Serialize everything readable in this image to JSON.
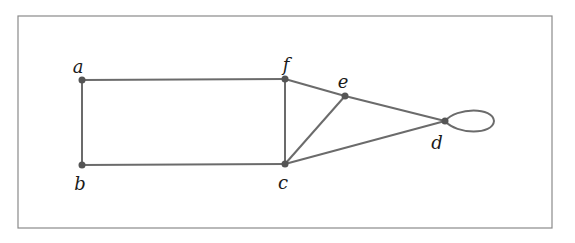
{
  "diagram": {
    "type": "graph",
    "frame": {
      "x": 18,
      "y": 16,
      "width": 534,
      "height": 212,
      "stroke": "#8a8a8a"
    },
    "colors": {
      "edge": "#6b6b6b",
      "node": "#555555",
      "label": "#1a1a1a"
    },
    "nodes": [
      {
        "id": "a",
        "label": "a",
        "x": 82,
        "y": 80,
        "lx": 78,
        "ly": 73
      },
      {
        "id": "b",
        "label": "b",
        "x": 82,
        "y": 165,
        "lx": 80,
        "ly": 190
      },
      {
        "id": "f",
        "label": "f",
        "x": 285,
        "y": 79,
        "lx": 286,
        "ly": 71
      },
      {
        "id": "c",
        "label": "c",
        "x": 285,
        "y": 164,
        "lx": 283,
        "ly": 189
      },
      {
        "id": "e",
        "label": "e",
        "x": 345,
        "y": 96,
        "lx": 343,
        "ly": 88
      },
      {
        "id": "d",
        "label": "d",
        "x": 445,
        "y": 121,
        "lx": 437,
        "ly": 149
      }
    ],
    "edges": [
      [
        "a",
        "f"
      ],
      [
        "a",
        "b"
      ],
      [
        "b",
        "c"
      ],
      [
        "f",
        "c"
      ],
      [
        "f",
        "e"
      ],
      [
        "e",
        "d"
      ],
      [
        "c",
        "e"
      ],
      [
        "c",
        "d"
      ],
      [
        "d",
        "d"
      ]
    ]
  }
}
